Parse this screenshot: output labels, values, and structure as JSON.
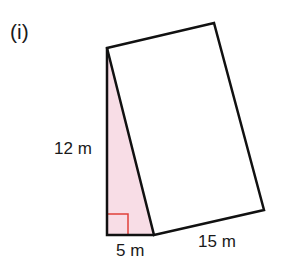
{
  "diagram": {
    "part_label": "(i)",
    "dimensions": {
      "height": "12 m",
      "base": "5 m",
      "length": "15 m"
    },
    "colors": {
      "outline": "#111111",
      "triangle_fill": "#f8dde6",
      "right_angle_marker": "#e0403a",
      "text": "#1a1a1a"
    },
    "shapes": {
      "triangle": "right triangle with legs 12 m (vertical) and 5 m (horizontal), shaded pink",
      "rectangle": "rectangle attached to the hypotenuse, with side 15 m"
    }
  }
}
